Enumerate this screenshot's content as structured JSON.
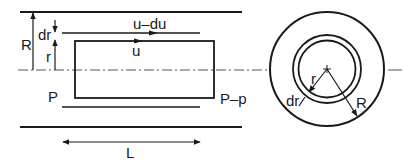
{
  "diagram": {
    "colors": {
      "ink": "#1a1a1a",
      "background": "#ffffff"
    },
    "side_view": {
      "labels": {
        "pipe_radius": "R",
        "element_radius": "r",
        "shell_thickness": "dr",
        "outer_velocity": "u–du",
        "inner_velocity": "u",
        "upstream_pressure": "P",
        "downstream_pressure": "P–p",
        "length": "L"
      }
    },
    "cross_section": {
      "labels": {
        "element_radius": "r",
        "shell_thickness": "dr",
        "pipe_radius": "R"
      }
    }
  }
}
